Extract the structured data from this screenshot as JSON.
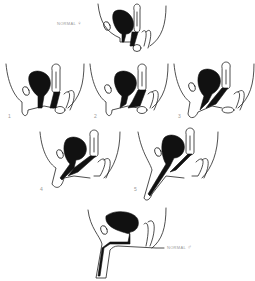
{
  "figure": {
    "panels": [
      {
        "id": "normal-female",
        "label": "NORMAL",
        "symbol": "♀"
      },
      {
        "id": "stage-1",
        "label": "1"
      },
      {
        "id": "stage-2",
        "label": "2"
      },
      {
        "id": "stage-3",
        "label": "3"
      },
      {
        "id": "stage-4",
        "label": "4"
      },
      {
        "id": "stage-5",
        "label": "5"
      },
      {
        "id": "normal-male",
        "label": "NORMAL",
        "symbol": "♂"
      }
    ],
    "colors": {
      "ink": "#111111",
      "background": "#ffffff",
      "label": "#999999"
    }
  }
}
